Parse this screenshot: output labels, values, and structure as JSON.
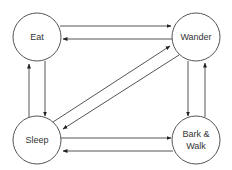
{
  "diagram": {
    "type": "state-transition",
    "nodes": [
      {
        "id": "eat",
        "label": "Eat"
      },
      {
        "id": "wander",
        "label": "Wander"
      },
      {
        "id": "sleep",
        "label": "Sleep"
      },
      {
        "id": "bark_walk",
        "label_line1": "Bark &",
        "label_line2": "Walk",
        "label": "Bark & Walk"
      }
    ],
    "edges": [
      {
        "from": "Eat",
        "to": "Wander"
      },
      {
        "from": "Wander",
        "to": "Eat"
      },
      {
        "from": "Eat",
        "to": "Sleep"
      },
      {
        "from": "Sleep",
        "to": "Eat"
      },
      {
        "from": "Sleep",
        "to": "Wander"
      },
      {
        "from": "Wander",
        "to": "Sleep"
      },
      {
        "from": "Wander",
        "to": "Bark & Walk"
      },
      {
        "from": "Bark & Walk",
        "to": "Wander"
      },
      {
        "from": "Sleep",
        "to": "Bark & Walk"
      },
      {
        "from": "Bark & Walk",
        "to": "Sleep"
      }
    ],
    "colors": {
      "stroke": "#555555",
      "text": "#333333",
      "background": "#ffffff"
    }
  }
}
